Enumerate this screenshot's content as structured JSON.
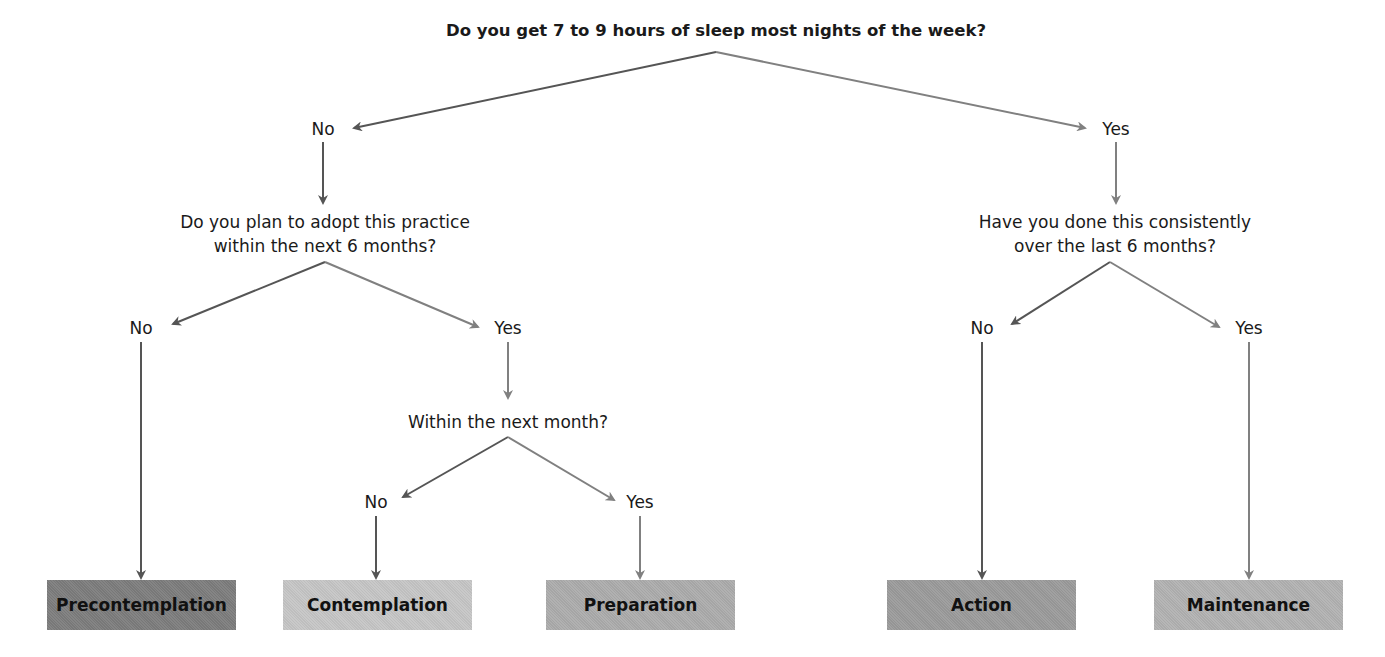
{
  "diagram": {
    "root_question": "Do you get 7 to 9 hours of sleep most nights of the week?",
    "left": {
      "answer": "No",
      "question_line1": "Do you plan to adopt this practice",
      "question_line2": "within the next 6 months?",
      "no": "No",
      "yes": "Yes",
      "sub_question": "Within the next month?",
      "sub_no": "No",
      "sub_yes": "Yes"
    },
    "right": {
      "answer": "Yes",
      "question_line1": "Have you done this consistently",
      "question_line2": "over the last 6 months?",
      "no": "No",
      "yes": "Yes"
    },
    "stages": [
      {
        "label": "Precontemplation",
        "color": "#7d7d7d"
      },
      {
        "label": "Contemplation",
        "color": "#c6c6c6"
      },
      {
        "label": "Preparation",
        "color": "#acacac"
      },
      {
        "label": "Action",
        "color": "#9b9b9b"
      },
      {
        "label": "Maintenance",
        "color": "#b2b2b2"
      }
    ],
    "colors": {
      "dark_arrow": "#555555",
      "light_arrow": "#808080"
    }
  }
}
